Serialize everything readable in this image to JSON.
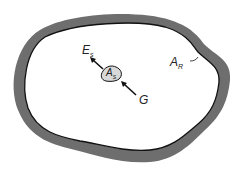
{
  "diagram": {
    "labels": {
      "emission": {
        "main": "E",
        "sub": "s"
      },
      "surface_area": {
        "main": "A",
        "sub": "s"
      },
      "irradiation": {
        "main": "G",
        "sub": ""
      },
      "enclosure_area": {
        "main": "A",
        "sub": "R"
      }
    },
    "colors": {
      "enclosure_wall": "#6e6e6e",
      "enclosure_edge": "#111111",
      "body_fill": "#d8d8d8",
      "arrow": "#111111"
    }
  }
}
